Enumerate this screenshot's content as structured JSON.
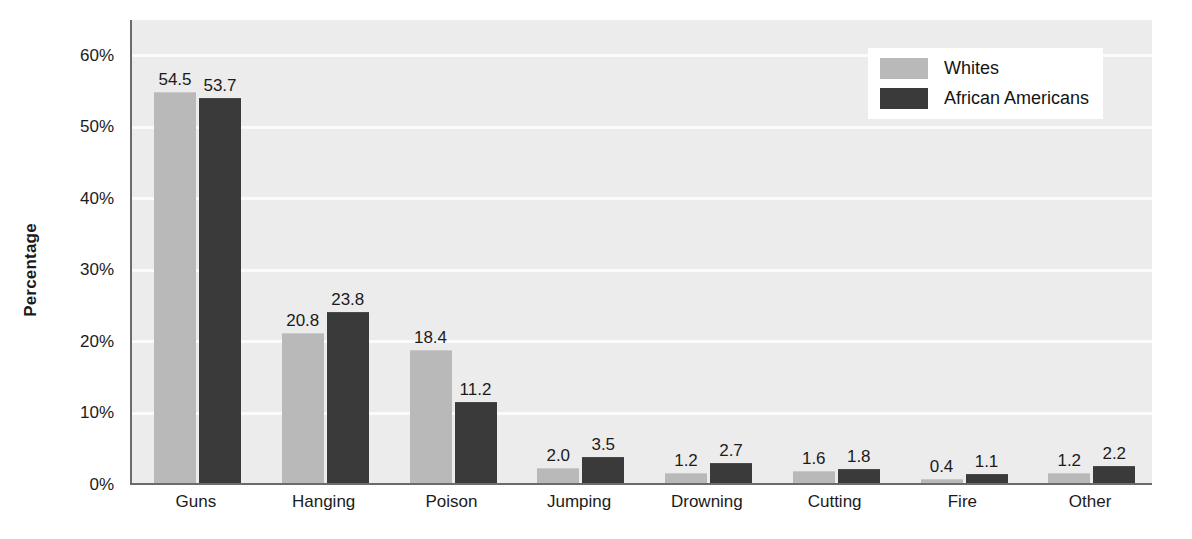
{
  "chart_data": {
    "type": "bar",
    "title": "",
    "subtitle": "",
    "xlabel": "",
    "ylabel": "Percentage",
    "ylim": [
      0,
      65
    ],
    "y_ticks": [
      0,
      10,
      20,
      30,
      40,
      50,
      60
    ],
    "y_tick_labels": [
      "0%",
      "10%",
      "20%",
      "30%",
      "40%",
      "50%",
      "60%"
    ],
    "grid": true,
    "grid_axis": "y",
    "legend_position": "top-right",
    "categories": [
      "Guns",
      "Hanging",
      "Poison",
      "Jumping",
      "Drowning",
      "Cutting",
      "Fire",
      "Other"
    ],
    "series": [
      {
        "name": "Whites",
        "color": "#b9b9b9",
        "values": [
          54.5,
          20.8,
          18.4,
          2.0,
          1.2,
          1.6,
          0.4,
          1.2
        ],
        "labels": [
          "54.5",
          "20.8",
          "18.4",
          "2.0",
          "1.2",
          "1.6",
          "0.4",
          "1.2"
        ]
      },
      {
        "name": "African Americans",
        "color": "#3a3a3a",
        "values": [
          53.7,
          23.8,
          11.2,
          3.5,
          2.7,
          1.8,
          1.1,
          2.2
        ],
        "labels": [
          "53.7",
          "23.8",
          "11.2",
          "3.5",
          "2.7",
          "1.8",
          "1.1",
          "2.2"
        ]
      }
    ]
  },
  "legend": {
    "entries": [
      {
        "label": "Whites",
        "color": "#b9b9b9"
      },
      {
        "label": "African Americans",
        "color": "#3a3a3a"
      }
    ]
  },
  "axes": {
    "y_title": "Percentage",
    "y_tick_labels": [
      "60%",
      "50%",
      "40%",
      "30%",
      "20%",
      "10%",
      "0%"
    ],
    "x_tick_labels": [
      "Guns",
      "Hanging",
      "Poison",
      "Jumping",
      "Drowning",
      "Cutting",
      "Fire",
      "Other"
    ]
  },
  "colors": {
    "plot_background": "#ececec",
    "gridline": "#fbfbfb",
    "axis_line": "#6b6b6b",
    "text": "#1b1b1b",
    "page_background": "#ffffff"
  }
}
